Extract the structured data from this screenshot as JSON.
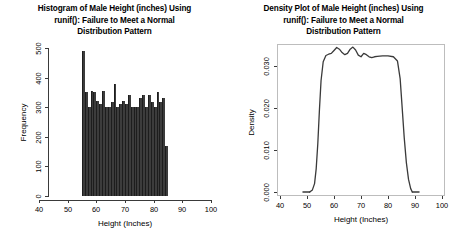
{
  "figure": {
    "background": "#ffffff",
    "panel_count": 2
  },
  "panels": [
    {
      "name": "histogram-panel",
      "title_lines": [
        "Histogram of Male Height (inches) Using",
        "runif(): Failure to Meet a Normal",
        "Distribution Pattern"
      ],
      "xlabel": "Height (Inches)",
      "ylabel": "Frequency",
      "xticks": [
        "40",
        "50",
        "60",
        "70",
        "80",
        "90",
        "100"
      ],
      "yticks": [
        "0",
        "100",
        "200",
        "300",
        "400",
        "500"
      ]
    },
    {
      "name": "density-panel",
      "title_lines": [
        "Density Plot of Male Height (inches) Using",
        "runif(): Failure to Meet a Normal",
        "Distribution Pattern"
      ],
      "xlabel": "Height (Inches)",
      "ylabel": "Density",
      "xticks": [
        "40",
        "50",
        "60",
        "70",
        "80",
        "90",
        "100"
      ],
      "yticks": [
        "0.000",
        "0.010",
        "0.020",
        "0.030"
      ]
    }
  ],
  "chart_data": [
    {
      "type": "bar",
      "name": "histogram-of-male-height",
      "title": "Histogram of Male Height (inches) Using runif(): Failure to Meet a Normal Distribution Pattern",
      "xlabel": "Height (Inches)",
      "ylabel": "Frequency",
      "xlim": [
        40,
        100
      ],
      "ylim": [
        0,
        500
      ],
      "xticks": [
        40,
        50,
        60,
        70,
        80,
        90,
        100
      ],
      "yticks": [
        0,
        100,
        200,
        300,
        400,
        500
      ],
      "grid": false,
      "legend": null,
      "bar_color": "#3c3c3c",
      "bin_width": 1,
      "bin_start": 55,
      "bin_end": 85,
      "bin_edges": [
        55,
        56,
        57,
        58,
        59,
        60,
        61,
        62,
        63,
        64,
        65,
        66,
        67,
        68,
        69,
        70,
        71,
        72,
        73,
        74,
        75,
        76,
        77,
        78,
        79,
        80,
        81,
        82,
        83,
        84,
        85
      ],
      "values": [
        490,
        352,
        300,
        355,
        352,
        322,
        310,
        355,
        300,
        300,
        318,
        378,
        302,
        312,
        322,
        310,
        340,
        300,
        302,
        300,
        330,
        342,
        300,
        340,
        318,
        300,
        352,
        318,
        330,
        170
      ],
      "note": "Approximately uniform frequencies near 300-360 with one tall leftmost bin and a short rightmost bin."
    },
    {
      "type": "line",
      "name": "density-plot-of-male-height",
      "title": "Density Plot of Male Height (inches) Using runif(): Failure to Meet a Normal Distribution Pattern",
      "xlabel": "Height (Inches)",
      "ylabel": "Density",
      "xlim": [
        40,
        100
      ],
      "ylim": [
        0.0,
        0.036
      ],
      "xticks": [
        40,
        50,
        60,
        70,
        80,
        90,
        100
      ],
      "yticks": [
        0.0,
        0.01,
        0.02,
        0.03
      ],
      "grid": false,
      "legend": null,
      "line_color": "#3a3a3a",
      "x": [
        51.0,
        52.0,
        52.8,
        53.4,
        54.0,
        54.6,
        55.2,
        56.0,
        57.0,
        58.0,
        59.0,
        60.0,
        61.0,
        62.0,
        63.0,
        64.0,
        65.0,
        66.0,
        67.0,
        68.0,
        69.0,
        70.0,
        71.0,
        72.0,
        73.0,
        74.0,
        75.0,
        76.0,
        78.0,
        80.0,
        82.0,
        83.5,
        84.5,
        85.2,
        86.0,
        86.8,
        87.6,
        88.4,
        89.0
      ],
      "y": [
        0.0,
        0.0005,
        0.002,
        0.0055,
        0.0115,
        0.0195,
        0.0265,
        0.031,
        0.0325,
        0.0328,
        0.033,
        0.0337,
        0.0344,
        0.034,
        0.0332,
        0.0327,
        0.033,
        0.034,
        0.0345,
        0.0338,
        0.0326,
        0.0322,
        0.033,
        0.0327,
        0.0322,
        0.032,
        0.0322,
        0.0323,
        0.0324,
        0.0324,
        0.0322,
        0.0312,
        0.027,
        0.0205,
        0.013,
        0.007,
        0.003,
        0.0008,
        0.0
      ],
      "note": "Flat plateau near 0.033 between roughly 56 and 84 inches with steep edges, characteristic of a uniform distribution."
    }
  ]
}
